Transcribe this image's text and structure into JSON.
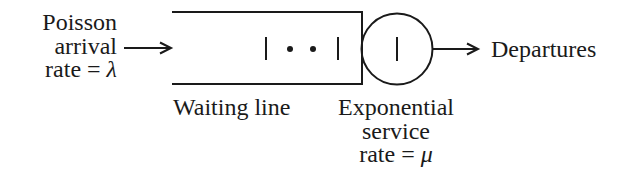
{
  "diagram": {
    "type": "queueing-system-M/M/1",
    "arrival": {
      "lines": [
        "Poisson",
        "arrival",
        "rate = λ"
      ],
      "line1": "Poisson",
      "line2": "arrival",
      "line3_prefix": "rate = ",
      "line3_symbol": "λ"
    },
    "waiting_line": {
      "label": "Waiting line",
      "ellipsis": "| • • |"
    },
    "server": {
      "lines": [
        "Exponential",
        "service",
        "rate = μ"
      ],
      "line1": "Exponential",
      "line2": "service",
      "line3_prefix": "rate = ",
      "line3_symbol": "μ"
    },
    "departures": {
      "label": "Departures"
    },
    "colors": {
      "stroke": "#1a1a1a",
      "background": "#ffffff"
    }
  }
}
